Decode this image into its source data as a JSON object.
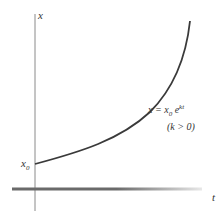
{
  "axes": {
    "x_label": "t",
    "y_label": "x"
  },
  "labels": {
    "intercept": "x",
    "intercept_sub": "0",
    "formula_lhs": "x = x",
    "formula_sub": "0",
    "formula_base": " e",
    "formula_exp": "kt",
    "condition": "(k > 0)"
  },
  "colors": {
    "axis": "#888888",
    "curve": "#3a3a3a",
    "text": "#333333"
  }
}
